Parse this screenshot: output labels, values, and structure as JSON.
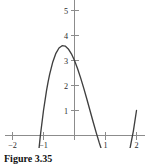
{
  "caption": {
    "text": "Figure 3.35"
  },
  "colors": {
    "curve": "#3f3f3f",
    "axis": "#8c8c8c",
    "text": "#2b2b2b",
    "background": "#ffffff"
  },
  "chart_data": {
    "type": "line",
    "title": "Figure 3.35",
    "xlabel": "",
    "ylabel": "",
    "xlim": [
      -2.15,
      2.2
    ],
    "ylim": [
      -0.45,
      5.6
    ],
    "xticks": [
      -2,
      -1,
      1,
      2
    ],
    "yticks": [
      1,
      2,
      3,
      4,
      5
    ],
    "xtick_labels": [
      "−2",
      "−1",
      "1",
      "2"
    ],
    "ytick_labels": [
      "1",
      "2",
      "3",
      "4",
      "5"
    ],
    "grid": false,
    "legend": false,
    "series": [
      {
        "name": "cubic",
        "x": [
          -1.84,
          -1.8,
          -1.7,
          -1.6,
          -1.5,
          -1.4,
          -1.3,
          -1.2,
          -1.1,
          -1.0,
          -0.9,
          -0.85,
          -0.8,
          -0.7,
          -0.6,
          -0.5,
          -0.4,
          -0.3,
          -0.2,
          -0.1,
          0.0,
          0.1,
          0.2,
          0.3,
          0.4,
          0.5,
          0.6,
          0.7,
          0.8,
          0.9,
          1.0,
          1.1,
          1.16,
          1.2,
          1.3,
          1.4,
          1.5,
          1.6,
          1.7,
          1.8,
          1.9,
          2.0
        ],
        "y": [
          -0.09,
          0.05,
          0.46,
          0.83,
          1.17,
          1.46,
          1.72,
          1.94,
          2.12,
          2.27,
          2.37,
          2.41,
          2.44,
          2.47,
          2.47,
          2.43,
          2.36,
          2.25,
          2.11,
          1.93,
          1.71,
          1.46,
          1.18,
          0.87,
          0.53,
          0.16,
          -0.24,
          -0.66,
          -1.1,
          -1.57,
          -2.05,
          -2.55,
          -2.85,
          -3.06,
          -3.58,
          -4.1,
          -4.62,
          -5.13,
          -5.62,
          -6.09,
          -6.53,
          -6.93
        ]
      }
    ],
    "notes": {
      "x_intercept": -1.79,
      "local_max": {
        "x": -0.85,
        "y": 4.4
      },
      "y_intercept": 3.0,
      "local_min": {
        "x": 1.16,
        "y": 0.6
      },
      "right_endpoint": {
        "x": 2.0,
        "y": 3.0
      },
      "left_endpoint": {
        "x": -1.84,
        "y": 0.0
      }
    }
  }
}
